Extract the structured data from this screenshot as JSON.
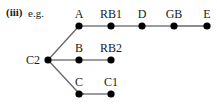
{
  "heading": {
    "marker": "(iii)",
    "prefix": "e.g."
  },
  "colors": {
    "node": "#000000",
    "edge": "#666666",
    "text": "#1a1a1a"
  },
  "nodes": [
    {
      "id": "A",
      "label": "A",
      "x": 79,
      "y": 26
    },
    {
      "id": "RB1",
      "label": "RB1",
      "x": 111,
      "y": 26
    },
    {
      "id": "D",
      "label": "D",
      "x": 142,
      "y": 26
    },
    {
      "id": "GB",
      "label": "GB",
      "x": 174,
      "y": 26
    },
    {
      "id": "E",
      "label": "E",
      "x": 207,
      "y": 26
    },
    {
      "id": "C2",
      "label": "C2",
      "x": 48,
      "y": 60
    },
    {
      "id": "B",
      "label": "B",
      "x": 79,
      "y": 60
    },
    {
      "id": "RB2",
      "label": "RB2",
      "x": 111,
      "y": 60
    },
    {
      "id": "C",
      "label": "C",
      "x": 79,
      "y": 94
    },
    {
      "id": "C1",
      "label": "C1",
      "x": 111,
      "y": 94
    }
  ],
  "edges": [
    [
      "C2",
      "A"
    ],
    [
      "A",
      "RB1"
    ],
    [
      "RB1",
      "D"
    ],
    [
      "D",
      "GB"
    ],
    [
      "GB",
      "E"
    ],
    [
      "C2",
      "B"
    ],
    [
      "B",
      "RB2"
    ],
    [
      "C2",
      "C"
    ],
    [
      "C",
      "C1"
    ]
  ]
}
